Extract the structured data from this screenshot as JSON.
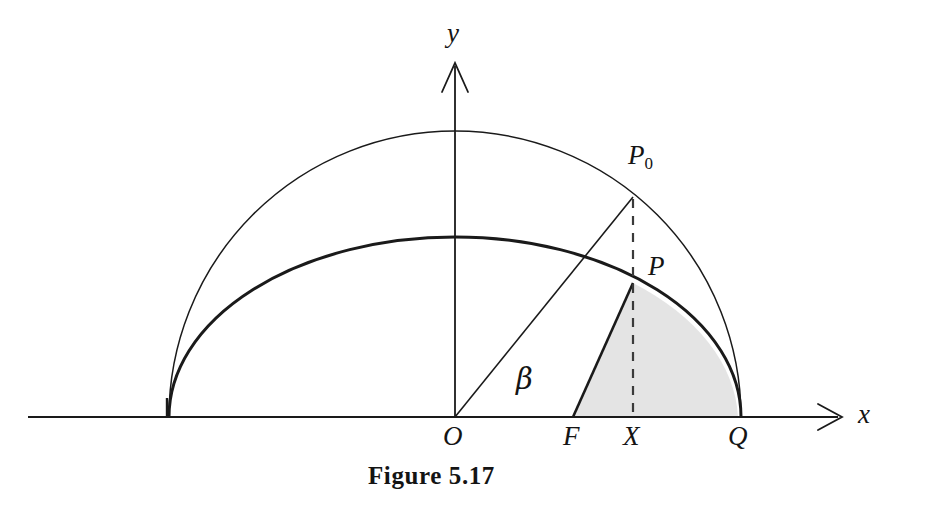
{
  "figure": {
    "caption": "Figure 5.17",
    "axes": {
      "x_label": "x",
      "y_label": "y",
      "origin_label": "O"
    },
    "points": [
      {
        "id": "P0",
        "label": "P",
        "subscript": "0",
        "x": 633,
        "y": 197,
        "on": "circle"
      },
      {
        "id": "P",
        "label": "P",
        "subscript": "",
        "x": 633,
        "y": 283,
        "on": "ellipse"
      },
      {
        "id": "F",
        "label": "F",
        "subscript": "",
        "x": 573,
        "y": 417,
        "on": "x-axis"
      },
      {
        "id": "X",
        "label": "X",
        "subscript": "",
        "x": 633,
        "y": 417,
        "on": "x-axis"
      },
      {
        "id": "Q",
        "label": "Q",
        "subscript": "",
        "x": 738,
        "y": 417,
        "on": "x-axis"
      },
      {
        "id": "O",
        "label": "O",
        "subscript": "",
        "x": 455,
        "y": 417,
        "on": "origin"
      }
    ],
    "angle_label": "β",
    "colors": {
      "stroke": "#1a1a1a",
      "shade_fill": "#e4e4e4",
      "shade_stroke": "#1a1a1a",
      "background": "#ffffff"
    },
    "geometry": {
      "center_x": 455,
      "baseline_y": 417,
      "circle_radius": 286,
      "ellipse_semi_major": 286,
      "ellipse_semi_minor": 180,
      "x_axis_start": 28,
      "x_axis_end": 840,
      "y_axis_top": 65,
      "beta_degrees": 50
    }
  }
}
